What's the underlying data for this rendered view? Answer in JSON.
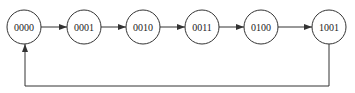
{
  "diagram": {
    "type": "state-cycle",
    "states": [
      {
        "id": "s0",
        "label": "0000",
        "cx": 24
      },
      {
        "id": "s1",
        "label": "0001",
        "cx": 84
      },
      {
        "id": "s2",
        "label": "0010",
        "cx": 143
      },
      {
        "id": "s3",
        "label": "0011",
        "cx": 202
      },
      {
        "id": "s4",
        "label": "0100",
        "cx": 261
      },
      {
        "id": "s5",
        "label": "1001",
        "cx": 329
      }
    ],
    "transitions": [
      [
        "0000",
        "0001"
      ],
      [
        "0001",
        "0010"
      ],
      [
        "0010",
        "0011"
      ],
      [
        "0011",
        "0100"
      ],
      [
        "0100",
        "1001"
      ],
      [
        "1001",
        "0000"
      ]
    ],
    "colors": {
      "stroke": "#333333",
      "background": "#ffffff"
    }
  }
}
